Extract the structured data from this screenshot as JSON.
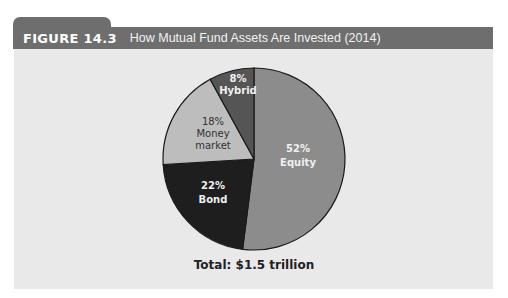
{
  "figure": {
    "number": "FIGURE 14.3",
    "title": "How Mutual Fund Assets Are Invested (2014)",
    "total_label": "Total: $1.5 trillion"
  },
  "slices": [
    {
      "pct": "52%",
      "name": "Equity",
      "color": "#8c8c8c",
      "text_color": "#f0f0f0"
    },
    {
      "pct": "22%",
      "name": "Bond",
      "color": "#1e1e1e",
      "text_color": "#f0f0f0"
    },
    {
      "pct": "18%",
      "name": "Money market",
      "name_line1": "Money",
      "name_line2": "market",
      "color": "#bdbdbd",
      "text_color": "#333333"
    },
    {
      "pct": "8%",
      "name": "Hybrid",
      "color": "#555555",
      "text_color": "#f0f0f0"
    }
  ],
  "chart_data": {
    "type": "pie",
    "title": "How Mutual Fund Assets Are Invested (2014)",
    "categories": [
      "Equity",
      "Bond",
      "Money market",
      "Hybrid"
    ],
    "values": [
      52,
      22,
      18,
      8
    ],
    "unit": "%",
    "annotations": [
      "Total: $1.5 trillion"
    ],
    "legend": "none (inline labels)",
    "start_angle": "12 o'clock, clockwise"
  }
}
